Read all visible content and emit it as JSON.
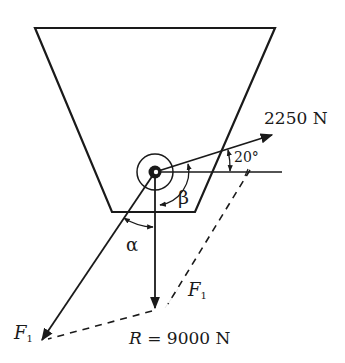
{
  "diagram": {
    "title": "",
    "labels": {
      "force_2250": "2250 N",
      "angle_20": "20°",
      "beta": "β",
      "alpha": "α",
      "f1_right_main": "F",
      "f1_right_sub": "1",
      "f1_left_main": "F",
      "f1_left_sub": "1",
      "resultant_var": "R",
      "resultant_value": " = 9000 N"
    },
    "elements": [
      {
        "name": "hopper",
        "type": "trapezoid"
      },
      {
        "name": "pulley",
        "type": "concentric-circles"
      },
      {
        "name": "force-2250",
        "type": "arrow",
        "magnitude": "2250 N",
        "angle_deg_above_horizontal": 20
      },
      {
        "name": "resultant",
        "type": "arrow",
        "magnitude": "R = 9000 N",
        "direction": "down"
      },
      {
        "name": "force-f1",
        "type": "arrow",
        "label": "F1",
        "angle": "alpha from vertical"
      },
      {
        "name": "parallelogram-dashed",
        "type": "dashed-lines"
      }
    ],
    "colors": {
      "stroke": "#1a1a1a",
      "background": "#ffffff"
    }
  }
}
